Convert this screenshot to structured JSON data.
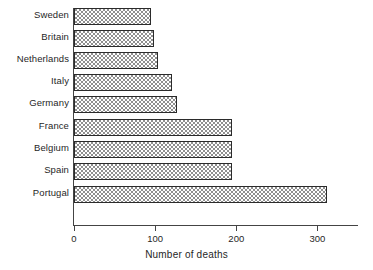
{
  "chart_data": {
    "type": "bar",
    "orientation": "horizontal",
    "title": "",
    "subtitle": "",
    "xlabel": "Number of deaths",
    "ylabel": "",
    "categories": [
      "Sweden",
      "Britain",
      "Netherlands",
      "Italy",
      "Germany",
      "France",
      "Belgium",
      "Spain",
      "Portugal"
    ],
    "values": [
      95,
      98,
      104,
      121,
      127,
      195,
      195,
      195,
      312
    ],
    "xlim": [
      0,
      350
    ],
    "ylim": null,
    "xticks": [
      0,
      100,
      200,
      300
    ],
    "xtick_labels": [
      "0",
      "100",
      "200",
      "300"
    ],
    "grid": false,
    "legend": null,
    "legend_position": "none",
    "annotations": [],
    "series": [
      {
        "name": "Number of deaths",
        "values": [
          95,
          98,
          104,
          121,
          127,
          195,
          195,
          195,
          312
        ]
      }
    ]
  },
  "style": {
    "bar_fill": "#8f8f8f",
    "bar_pattern": "checkerboard-dither",
    "bar_border": "#2b2b2b",
    "axis_color": "#444444",
    "text_color": "#1f1f1f",
    "background": "#ffffff"
  }
}
